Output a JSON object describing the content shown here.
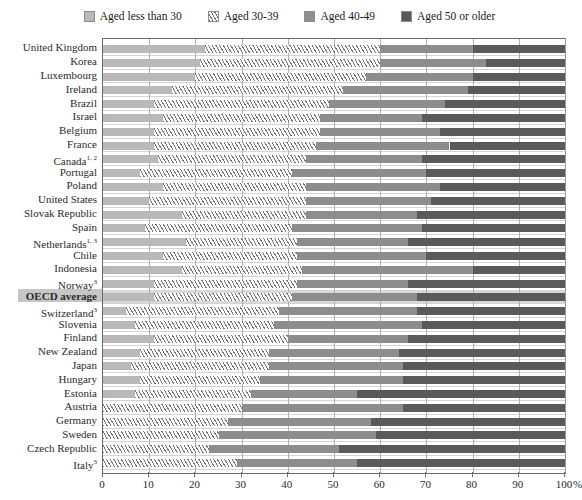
{
  "legend": {
    "items": [
      {
        "label": "Aged less than 30",
        "swatch": "light-gray",
        "color": "#b9b9b9"
      },
      {
        "label": "Aged 30-39",
        "swatch": "hatched",
        "color": "#ffffff"
      },
      {
        "label": "Aged 40-49",
        "swatch": "medium-gray",
        "color": "#8d8d8d"
      },
      {
        "label": "Aged 50 or older",
        "swatch": "dark-gray",
        "color": "#5a5a5a"
      }
    ]
  },
  "axis": {
    "ticks": [
      "0",
      "10",
      "20",
      "30",
      "40",
      "50",
      "60",
      "70",
      "80",
      "90",
      "100"
    ],
    "unit": "%"
  },
  "chart_data": {
    "type": "bar",
    "orientation": "horizontal",
    "stacked": true,
    "percent_stacked": true,
    "title": "",
    "xlabel": "%",
    "ylabel": "",
    "xlim": [
      0,
      100
    ],
    "grid": true,
    "legend_position": "top-center",
    "series": [
      {
        "name": "Aged less than 30",
        "color": "#b9b9b9"
      },
      {
        "name": "Aged 30-39",
        "color": "#ffffff"
      },
      {
        "name": "Aged 40-49",
        "color": "#8d8d8d"
      },
      {
        "name": "Aged 50 or older",
        "color": "#5a5a5a"
      }
    ],
    "categories": [
      "United Kingdom",
      "Korea",
      "Luxembourg",
      "Ireland",
      "Brazil",
      "Israel",
      "Belgium",
      "France",
      "Canada",
      "Portugal",
      "Poland",
      "United States",
      "Slovak Republic",
      "Spain",
      "Netherlands",
      "Chile",
      "Indonesia",
      "Norway",
      "OECD average",
      "Switzerland",
      "Slovenia",
      "Finland",
      "New Zealand",
      "Japan",
      "Hungary",
      "Estonia",
      "Austria",
      "Germany",
      "Sweden",
      "Czech Republic",
      "Italy"
    ],
    "category_footnotes": [
      "",
      "",
      "",
      "",
      "",
      "",
      "",
      "",
      "1, 2",
      "",
      "",
      "",
      "",
      "",
      "1, 3",
      "",
      "",
      "3",
      "",
      "3",
      "",
      "",
      "",
      "",
      "",
      "",
      "",
      "",
      "",
      "",
      "3"
    ],
    "highlight_category": "OECD average",
    "rows": [
      {
        "label": "United Kingdom",
        "footnote": "",
        "values": [
          22,
          38,
          20,
          20
        ]
      },
      {
        "label": "Korea",
        "footnote": "",
        "values": [
          21,
          39,
          23,
          17
        ]
      },
      {
        "label": "Luxembourg",
        "footnote": "",
        "values": [
          20,
          37,
          23,
          20
        ]
      },
      {
        "label": "Ireland",
        "footnote": "",
        "values": [
          15,
          37,
          27,
          21
        ]
      },
      {
        "label": "Brazil",
        "footnote": "",
        "values": [
          11,
          38,
          25,
          26
        ]
      },
      {
        "label": "Israel",
        "footnote": "",
        "values": [
          13,
          34,
          22,
          31
        ]
      },
      {
        "label": "Belgium",
        "footnote": "",
        "values": [
          11,
          36,
          26,
          27
        ]
      },
      {
        "label": "France",
        "footnote": "",
        "values": [
          11,
          35,
          29,
          25
        ]
      },
      {
        "label": "Canada",
        "footnote": "1, 2",
        "values": [
          12,
          32,
          25,
          31
        ]
      },
      {
        "label": "Portugal",
        "footnote": "",
        "values": [
          8,
          33,
          29,
          30
        ]
      },
      {
        "label": "Poland",
        "footnote": "",
        "values": [
          13,
          31,
          29,
          27
        ]
      },
      {
        "label": "United States",
        "footnote": "",
        "values": [
          10,
          34,
          27,
          29
        ]
      },
      {
        "label": "Slovak Republic",
        "footnote": "",
        "values": [
          17,
          27,
          24,
          32
        ]
      },
      {
        "label": "Spain",
        "footnote": "",
        "values": [
          9,
          32,
          28,
          31
        ]
      },
      {
        "label": "Netherlands",
        "footnote": "1, 3",
        "values": [
          18,
          24,
          24,
          34
        ]
      },
      {
        "label": "Chile",
        "footnote": "",
        "values": [
          13,
          29,
          28,
          30
        ]
      },
      {
        "label": "Indonesia",
        "footnote": "",
        "values": [
          17,
          26,
          37,
          20
        ]
      },
      {
        "label": "Norway",
        "footnote": "3",
        "values": [
          11,
          31,
          24,
          34
        ]
      },
      {
        "label": "OECD average",
        "footnote": "",
        "values": [
          11,
          30,
          27,
          32
        ]
      },
      {
        "label": "Switzerland",
        "footnote": "3",
        "values": [
          5,
          33,
          30,
          32
        ]
      },
      {
        "label": "Slovenia",
        "footnote": "",
        "values": [
          7,
          30,
          32,
          31
        ]
      },
      {
        "label": "Finland",
        "footnote": "",
        "values": [
          11,
          29,
          26,
          34
        ]
      },
      {
        "label": "New Zealand",
        "footnote": "",
        "values": [
          8,
          28,
          28,
          36
        ]
      },
      {
        "label": "Japan",
        "footnote": "",
        "values": [
          6,
          30,
          29,
          35
        ]
      },
      {
        "label": "Hungary",
        "footnote": "",
        "values": [
          8,
          26,
          31,
          35
        ]
      },
      {
        "label": "Estonia",
        "footnote": "",
        "values": [
          7,
          25,
          23,
          45
        ]
      },
      {
        "label": "Austria",
        "footnote": "",
        "values": [
          0,
          30,
          35,
          35
        ]
      },
      {
        "label": "Germany",
        "footnote": "",
        "values": [
          0,
          27,
          31,
          42
        ]
      },
      {
        "label": "Sweden",
        "footnote": "",
        "values": [
          0,
          25,
          34,
          41
        ]
      },
      {
        "label": "Czech Republic",
        "footnote": "",
        "values": [
          0,
          23,
          28,
          49
        ]
      },
      {
        "label": "Italy",
        "footnote": "3",
        "values": [
          0,
          29,
          26,
          45
        ]
      }
    ]
  }
}
